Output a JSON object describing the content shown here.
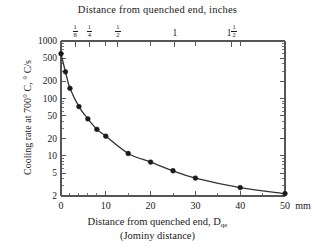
{
  "chart_data": {
    "type": "line",
    "title": "",
    "top_axis": {
      "label": "Distance from quenched end, inches",
      "ticks": [
        {
          "value_mm": 3.175,
          "label": "1/8",
          "num": "1",
          "den": "8",
          "whole": ""
        },
        {
          "value_mm": 6.35,
          "label": "1/4",
          "num": "1",
          "den": "4",
          "whole": ""
        },
        {
          "value_mm": 12.7,
          "label": "1/2",
          "num": "1",
          "den": "2",
          "whole": ""
        },
        {
          "value_mm": 25.4,
          "label": "1",
          "num": "",
          "den": "",
          "whole": "1"
        },
        {
          "value_mm": 38.1,
          "label": "1 1/2",
          "num": "1",
          "den": "2",
          "whole": "1"
        },
        {
          "value_mm": 50.8,
          "label": "2",
          "num": "",
          "den": "",
          "whole": "2"
        }
      ]
    },
    "xlabel_line1": "Distance from quenched end, D",
    "xlabel_sub": "qe",
    "xlabel_line2": "(Jominy distance)",
    "ylabel": "Cooling rate at 700° C, ° C/s",
    "xlim": [
      0,
      50
    ],
    "xunit": "mm",
    "xticks": [
      0,
      10,
      20,
      30,
      40,
      50
    ],
    "xticklabels": [
      "0",
      "10",
      "20",
      "30",
      "40",
      "50"
    ],
    "x_minor_ticks": [
      2,
      4,
      6,
      8,
      15,
      25,
      35,
      45
    ],
    "ylim": [
      2,
      1000
    ],
    "yscale": "log",
    "yticks": [
      1000,
      500,
      200,
      100,
      50,
      20,
      10,
      5,
      2
    ],
    "yticklabels": [
      "1000",
      "500",
      "200",
      "100",
      "50",
      "20",
      "10",
      "5",
      "2"
    ],
    "grid": false,
    "legend": null,
    "series": [
      {
        "name": "Cooling rate",
        "marker": "filled-circle",
        "color": "#1a1a1a",
        "x": [
          0,
          1,
          2,
          4,
          6,
          8,
          10,
          15,
          20,
          25,
          30,
          40,
          50
        ],
        "y": [
          600,
          290,
          150,
          72,
          44,
          29,
          22,
          11,
          7.8,
          5.5,
          4.1,
          2.8,
          2.2
        ]
      }
    ]
  },
  "axis_unit_note": "mm",
  "colors": {
    "frame": "#555555",
    "ink": "#1a1a1a",
    "curve": "#333333"
  }
}
